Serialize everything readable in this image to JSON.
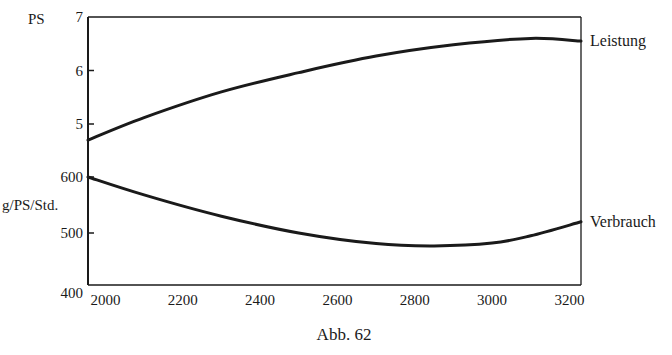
{
  "figure": {
    "caption": "Abb. 62"
  },
  "chart_data": {
    "type": "line",
    "title": "",
    "caption": "Abb. 62",
    "xlabel": "",
    "x_ticks": [
      2000,
      2200,
      2400,
      2600,
      2800,
      3000,
      3200
    ],
    "xlim": [
      1955,
      3230
    ],
    "grid": false,
    "legend": "inline labels at right end of curves",
    "axes": {
      "upper": {
        "ylabel": "PS",
        "y_ticks": [
          5,
          6,
          7
        ],
        "ylim": [
          4.6,
          7
        ]
      },
      "lower": {
        "ylabel": "g/PS/Std.",
        "y_ticks": [
          400,
          500,
          600
        ],
        "ylim": [
          387,
          600
        ]
      }
    },
    "series": [
      {
        "name": "Leistung",
        "axis": "upper",
        "unit": "PS",
        "x": [
          1955,
          2100,
          2300,
          2500,
          2700,
          2900,
          3100,
          3230
        ],
        "values": [
          4.7,
          5.12,
          5.6,
          5.96,
          6.27,
          6.48,
          6.6,
          6.55
        ]
      },
      {
        "name": "Verbrauch",
        "axis": "lower",
        "unit": "g/PS/Std.",
        "x": [
          1955,
          2100,
          2300,
          2500,
          2700,
          2850,
          3000,
          3100,
          3230
        ],
        "values": [
          600,
          568,
          530,
          500,
          481,
          477,
          482,
          495,
          520
        ]
      }
    ]
  },
  "colors": {
    "ink": "#1a1a1a",
    "background": "#ffffff"
  }
}
